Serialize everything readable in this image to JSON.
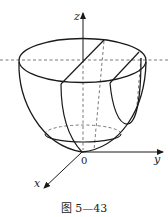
{
  "figure": {
    "type": "3D surface diagram (paraboloid bowl cut by planes)",
    "axes": {
      "z_label": "z",
      "y_label": "y",
      "x_label": "x",
      "origin_label": "0"
    },
    "caption": "图 5—43",
    "colors": {
      "stroke": "#1a1a1a",
      "dashed": "#555555",
      "background": "#ffffff"
    }
  }
}
